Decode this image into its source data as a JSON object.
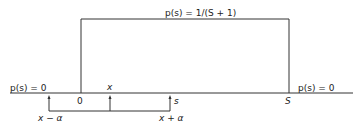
{
  "diagram": {
    "top_label": "p(s) = 1/(S + 1)",
    "left_label": "p(s) = 0",
    "right_label": "p(s) = 0",
    "axis_zero": "0",
    "axis_S": "S",
    "marker_x": "x",
    "marker_s": "s",
    "label_x_minus_a": "x − α",
    "label_x_plus_a": "x + α"
  },
  "colors": {
    "line": "#333333",
    "text": "#222222",
    "background": "#ffffff"
  }
}
